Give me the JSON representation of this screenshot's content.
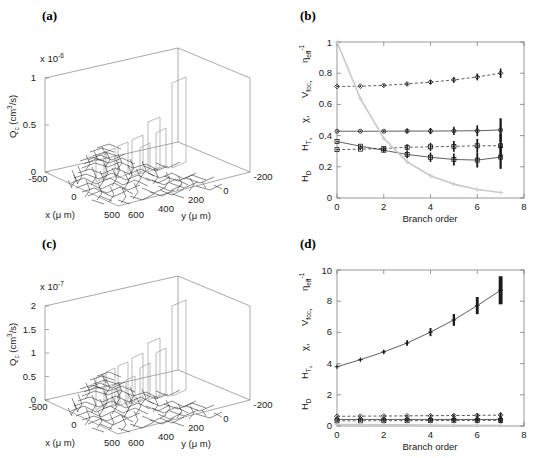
{
  "figure": {
    "panels": [
      {
        "id": "a",
        "label": "(a)"
      },
      {
        "id": "b",
        "label": "(b)"
      },
      {
        "id": "c",
        "label": "(c)"
      },
      {
        "id": "d",
        "label": "(d)"
      }
    ]
  },
  "panel_a": {
    "label": "(a)",
    "exponent_text": "x 10",
    "exponent_power": "-6",
    "zlabel_main": "Q",
    "zlabel_sub": "c",
    "zlabel_unit": " (cm",
    "zlabel_unit_sup": "3",
    "zlabel_unit_tail": "/s)",
    "xlabel": "x (μ m)",
    "ylabel": "y (μ m)",
    "zticks": [
      "0",
      "0.5",
      "1"
    ],
    "xticks": [
      "-500",
      "0",
      "500"
    ],
    "yticks": [
      "600",
      "400",
      "200",
      "0",
      "-200"
    ]
  },
  "panel_c": {
    "label": "(c)",
    "exponent_text": "x 10",
    "exponent_power": "-7",
    "zlabel_main": "Q",
    "zlabel_sub": "c",
    "zlabel_unit": " (cm",
    "zlabel_unit_sup": "3",
    "zlabel_unit_tail": "/s)",
    "xlabel": "x (μ m)",
    "ylabel": "y (μ m)",
    "zticks": [
      "0",
      "0.5",
      "1",
      "1.5",
      "2"
    ],
    "xticks": [
      "-500",
      "0",
      "500"
    ],
    "yticks": [
      "600",
      "400",
      "200",
      "0",
      "-200"
    ]
  },
  "panel_b": {
    "label": "(b)",
    "xlabel": "Branch order",
    "ylabel_parts": [
      {
        "main": "H",
        "sub": "D"
      },
      {
        "main": "H",
        "sub": "T"
      },
      {
        "main": "χ",
        "sub": ""
      },
      {
        "main": "V",
        "sub": "foc"
      },
      {
        "main": "η",
        "sub": "eff",
        "sup": "-1"
      }
    ],
    "ylabel_text": "H_D, H_T, χ, V_foc, η_eff^-1"
  },
  "panel_d": {
    "label": "(d)",
    "xlabel": "Branch order",
    "ylabel_parts": [
      {
        "main": "H",
        "sub": "D"
      },
      {
        "main": "H",
        "sub": "T"
      },
      {
        "main": "χ",
        "sub": ""
      },
      {
        "main": "V",
        "sub": "foc"
      },
      {
        "main": "η",
        "sub": "eff",
        "sup": "-1"
      }
    ],
    "ylabel_text": "H_D, H_T, χ, V_foc, η_eff^-1"
  },
  "colors": {
    "axis": "#555555",
    "data_dark": "#1a1a1a",
    "data_gray": "#c9c9c9",
    "data_mid": "#8a8a8a",
    "text": "#1a1a1a",
    "background": "#ffffff"
  },
  "chart_data": [
    {
      "panel": "b",
      "type": "line",
      "title": "",
      "xlabel": "Branch order",
      "ylabel": "H_D, H_T, χ, V_foc, η_eff^-1",
      "xlim": [
        0,
        8
      ],
      "ylim": [
        0,
        1
      ],
      "xticks": [
        0,
        2,
        4,
        6,
        8
      ],
      "yticks": [
        0,
        0.2,
        0.4,
        0.6,
        0.8,
        1
      ],
      "grid": false,
      "legend": "none",
      "x": [
        0,
        1,
        2,
        3,
        4,
        5,
        6,
        7
      ],
      "series": [
        {
          "name": "eta_eff^-1",
          "marker": "diamond",
          "linestyle": "dashed",
          "color": "#1a1a1a",
          "values": [
            0.715,
            0.717,
            0.722,
            0.731,
            0.743,
            0.757,
            0.776,
            0.8
          ],
          "spread": [
            0.004,
            0.005,
            0.007,
            0.01,
            0.014,
            0.018,
            0.022,
            0.03
          ]
        },
        {
          "name": "V_foc",
          "marker": "circle",
          "linestyle": "solid",
          "color": "#1a1a1a",
          "values": [
            0.428,
            0.428,
            0.428,
            0.429,
            0.429,
            0.43,
            0.431,
            0.436
          ],
          "spread": [
            0.003,
            0.004,
            0.006,
            0.016,
            0.02,
            0.026,
            0.035,
            0.075
          ]
        },
        {
          "name": "H_T",
          "marker": "square",
          "linestyle": "dashed",
          "color": "#1a1a1a",
          "values": [
            0.31,
            0.313,
            0.318,
            0.325,
            0.328,
            0.331,
            0.335,
            0.335
          ],
          "spread": [
            0.004,
            0.006,
            0.01,
            0.02,
            0.026,
            0.034,
            0.044,
            0.075
          ]
        },
        {
          "name": "H_D",
          "marker": "square",
          "linestyle": "solid",
          "color": "#1a1a1a",
          "values": [
            0.362,
            0.332,
            0.306,
            0.279,
            0.261,
            0.247,
            0.243,
            0.262
          ],
          "spread": [
            0.004,
            0.007,
            0.012,
            0.024,
            0.03,
            0.038,
            0.048,
            0.075
          ]
        },
        {
          "name": "chi",
          "marker": "plus",
          "linestyle": "solid",
          "color": "#c9c9c9",
          "values": [
            1.0,
            0.637,
            0.383,
            0.232,
            0.143,
            0.089,
            0.054,
            0.035
          ],
          "spread": [
            0,
            0,
            0,
            0,
            0,
            0,
            0,
            0
          ]
        }
      ]
    },
    {
      "panel": "d",
      "type": "line",
      "title": "",
      "xlabel": "Branch order",
      "ylabel": "H_D, H_T, χ, V_foc, η_eff^-1",
      "xlim": [
        0,
        8
      ],
      "ylim": [
        0,
        10
      ],
      "xticks": [
        0,
        2,
        4,
        6,
        8
      ],
      "yticks": [
        0,
        2,
        4,
        6,
        8,
        10
      ],
      "grid": false,
      "legend": "none",
      "x": [
        0,
        1,
        2,
        3,
        4,
        5,
        6,
        7
      ],
      "series": [
        {
          "name": "eta_eff^-1",
          "marker": "plus",
          "linestyle": "solid",
          "color": "#1a1a1a",
          "values": [
            3.8,
            4.25,
            4.75,
            5.32,
            6.02,
            6.8,
            7.72,
            8.7
          ],
          "spread": [
            0.04,
            0.08,
            0.12,
            0.18,
            0.26,
            0.38,
            0.55,
            0.9
          ]
        },
        {
          "name": "V_foc",
          "marker": "diamond",
          "linestyle": "dashed",
          "color": "#1a1a1a",
          "values": [
            0.62,
            0.63,
            0.64,
            0.65,
            0.66,
            0.67,
            0.68,
            0.7
          ],
          "spread": [
            0.03,
            0.04,
            0.05,
            0.06,
            0.07,
            0.09,
            0.11,
            0.16
          ]
        },
        {
          "name": "H_T",
          "marker": "square",
          "linestyle": "dashed",
          "color": "#1a1a1a",
          "values": [
            0.33,
            0.33,
            0.34,
            0.34,
            0.35,
            0.35,
            0.36,
            0.36
          ],
          "spread": [
            0.03,
            0.04,
            0.05,
            0.06,
            0.08,
            0.1,
            0.13,
            0.2
          ]
        },
        {
          "name": "H_D",
          "marker": "circle",
          "linestyle": "solid",
          "color": "#1a1a1a",
          "values": [
            0.42,
            0.42,
            0.42,
            0.42,
            0.42,
            0.42,
            0.42,
            0.42
          ],
          "spread": [
            0.02,
            0.03,
            0.04,
            0.05,
            0.07,
            0.09,
            0.12,
            0.18
          ]
        },
        {
          "name": "chi",
          "marker": "plus",
          "linestyle": "solid",
          "color": "#c9c9c9",
          "values": [
            0.1,
            0.09,
            0.08,
            0.07,
            0.06,
            0.05,
            0.04,
            0.04
          ],
          "spread": [
            0,
            0,
            0,
            0,
            0,
            0,
            0,
            0
          ]
        }
      ]
    }
  ],
  "network_3d": {
    "description": "Q_c stem plot over vascular network footprint",
    "panel_a_bar_peaks": [
      0.88,
      0.4,
      0.22,
      0.3,
      0.18,
      0.12
    ],
    "panel_c_bar_peaks": [
      1.85,
      0.95,
      0.7,
      0.55,
      0.4,
      0.28
    ]
  }
}
